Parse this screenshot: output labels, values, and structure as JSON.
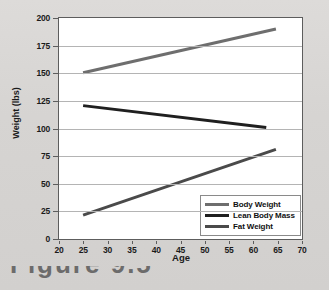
{
  "chart_data": {
    "type": "line",
    "title": "",
    "xlabel": "Age",
    "ylabel": "Weight (lbs)",
    "xlim": [
      20,
      70
    ],
    "ylim": [
      0,
      200
    ],
    "xticks": [
      20,
      25,
      30,
      35,
      40,
      45,
      50,
      55,
      60,
      65,
      70
    ],
    "yticks": [
      0,
      25,
      50,
      75,
      100,
      125,
      150,
      175,
      200
    ],
    "grid": "horizontal",
    "legend_position": "lower-right-inside",
    "series": [
      {
        "name": "Body Weight",
        "color": "#6e6e6e",
        "x": [
          25,
          65
        ],
        "values": [
          150,
          190
        ]
      },
      {
        "name": "Lean Body Mass",
        "color": "#1f1f1f",
        "x": [
          25,
          63
        ],
        "values": [
          120,
          100
        ]
      },
      {
        "name": "Fat Weight",
        "color": "#4a4a4a",
        "x": [
          25,
          65
        ],
        "values": [
          20,
          80
        ]
      }
    ]
  },
  "axes": {
    "y_label": "Weight (lbs)",
    "x_label": "Age",
    "y_tick_labels": [
      "200",
      "175",
      "150",
      "125",
      "100",
      "75",
      "50",
      "25",
      "0"
    ],
    "x_tick_labels": [
      "20",
      "25",
      "30",
      "35",
      "40",
      "45",
      "50",
      "55",
      "60",
      "65",
      "70"
    ]
  },
  "legend": {
    "items": [
      {
        "label": "Body Weight",
        "color": "#6e6e6e"
      },
      {
        "label": "Lean Body Mass",
        "color": "#1f1f1f"
      },
      {
        "label": "Fat Weight",
        "color": "#4a4a4a"
      }
    ]
  },
  "caption": {
    "partial_text": "Figure 9.5"
  },
  "colors": {
    "page_background": "#d9d9d7",
    "plot_background": "#ffffff",
    "plot_border": "#5d5d5d",
    "gridline": "#b4b4b4",
    "text": "#1a1a1a"
  }
}
